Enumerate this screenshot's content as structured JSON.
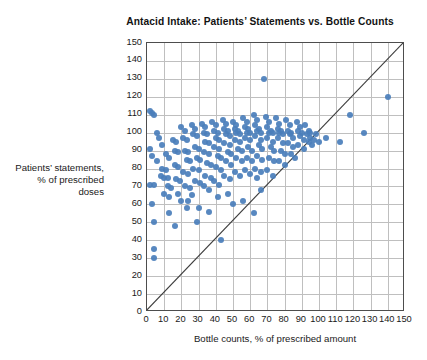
{
  "chart_data": {
    "type": "scatter",
    "title": "Antacid Intake: Patients’ Statements vs. Bottle Counts",
    "xlabel": "Bottle counts, % of prescribed amount",
    "ylabel": "Patients’ statements, % of prescribed doses",
    "xlim": [
      0,
      150
    ],
    "ylim": [
      0,
      150
    ],
    "xticks": [
      0,
      10,
      20,
      30,
      40,
      50,
      60,
      70,
      80,
      90,
      100,
      110,
      120,
      130,
      140,
      150
    ],
    "yticks": [
      0,
      10,
      20,
      30,
      40,
      50,
      60,
      70,
      80,
      90,
      100,
      110,
      120,
      130,
      140,
      150
    ],
    "grid": true,
    "legend": "none",
    "marker_color": "#4a7ebb",
    "reference_line": {
      "label": "y = x identity line",
      "from": [
        0,
        0
      ],
      "to": [
        150,
        150
      ],
      "color": "#3c3c3c"
    },
    "points": [
      [
        2,
        112
      ],
      [
        3,
        111
      ],
      [
        4,
        110
      ],
      [
        2,
        91
      ],
      [
        3,
        87
      ],
      [
        2,
        71
      ],
      [
        4,
        71
      ],
      [
        3,
        60
      ],
      [
        4,
        50
      ],
      [
        4,
        35
      ],
      [
        4,
        30
      ],
      [
        6,
        100
      ],
      [
        6,
        84
      ],
      [
        8,
        76
      ],
      [
        10,
        75
      ],
      [
        12,
        75
      ],
      [
        7,
        97
      ],
      [
        9,
        93
      ],
      [
        11,
        88
      ],
      [
        13,
        86
      ],
      [
        9,
        80
      ],
      [
        11,
        79
      ],
      [
        12,
        70
      ],
      [
        14,
        69
      ],
      [
        10,
        66
      ],
      [
        13,
        64
      ],
      [
        15,
        96
      ],
      [
        17,
        95
      ],
      [
        16,
        90
      ],
      [
        18,
        89
      ],
      [
        16,
        82
      ],
      [
        18,
        81
      ],
      [
        17,
        74
      ],
      [
        19,
        73
      ],
      [
        20,
        103
      ],
      [
        22,
        101
      ],
      [
        21,
        97
      ],
      [
        23,
        96
      ],
      [
        22,
        90
      ],
      [
        24,
        89
      ],
      [
        23,
        85
      ],
      [
        25,
        84
      ],
      [
        21,
        78
      ],
      [
        24,
        77
      ],
      [
        22,
        70
      ],
      [
        25,
        69
      ],
      [
        20,
        62
      ],
      [
        23,
        58
      ],
      [
        26,
        104
      ],
      [
        28,
        102
      ],
      [
        27,
        99
      ],
      [
        29,
        98
      ],
      [
        28,
        92
      ],
      [
        30,
        91
      ],
      [
        29,
        86
      ],
      [
        31,
        85
      ],
      [
        27,
        80
      ],
      [
        30,
        79
      ],
      [
        28,
        73
      ],
      [
        31,
        72
      ],
      [
        26,
        65
      ],
      [
        29,
        50
      ],
      [
        32,
        105
      ],
      [
        34,
        103
      ],
      [
        33,
        100
      ],
      [
        35,
        99
      ],
      [
        34,
        95
      ],
      [
        36,
        94
      ],
      [
        33,
        89
      ],
      [
        36,
        88
      ],
      [
        35,
        83
      ],
      [
        37,
        82
      ],
      [
        34,
        76
      ],
      [
        37,
        75
      ],
      [
        33,
        70
      ],
      [
        36,
        68
      ],
      [
        38,
        106
      ],
      [
        40,
        104
      ],
      [
        39,
        101
      ],
      [
        41,
        100
      ],
      [
        40,
        97
      ],
      [
        42,
        96
      ],
      [
        39,
        92
      ],
      [
        42,
        91
      ],
      [
        41,
        87
      ],
      [
        43,
        86
      ],
      [
        40,
        81
      ],
      [
        43,
        79
      ],
      [
        39,
        73
      ],
      [
        42,
        71
      ],
      [
        41,
        64
      ],
      [
        43,
        40
      ],
      [
        44,
        107
      ],
      [
        46,
        105
      ],
      [
        45,
        102
      ],
      [
        47,
        101
      ],
      [
        46,
        99
      ],
      [
        48,
        98
      ],
      [
        45,
        94
      ],
      [
        48,
        93
      ],
      [
        47,
        89
      ],
      [
        49,
        88
      ],
      [
        46,
        84
      ],
      [
        49,
        82
      ],
      [
        45,
        76
      ],
      [
        48,
        74
      ],
      [
        50,
        106
      ],
      [
        52,
        104
      ],
      [
        51,
        102
      ],
      [
        53,
        101
      ],
      [
        52,
        100
      ],
      [
        54,
        99
      ],
      [
        51,
        96
      ],
      [
        54,
        95
      ],
      [
        53,
        91
      ],
      [
        55,
        90
      ],
      [
        52,
        86
      ],
      [
        55,
        84
      ],
      [
        51,
        78
      ],
      [
        54,
        76
      ],
      [
        56,
        108
      ],
      [
        58,
        106
      ],
      [
        57,
        103
      ],
      [
        59,
        102
      ],
      [
        58,
        100
      ],
      [
        60,
        100
      ],
      [
        57,
        97
      ],
      [
        60,
        96
      ],
      [
        59,
        92
      ],
      [
        61,
        90
      ],
      [
        58,
        86
      ],
      [
        61,
        84
      ],
      [
        57,
        79
      ],
      [
        60,
        77
      ],
      [
        62,
        110
      ],
      [
        64,
        107
      ],
      [
        63,
        104
      ],
      [
        65,
        102
      ],
      [
        64,
        101
      ],
      [
        66,
        100
      ],
      [
        63,
        98
      ],
      [
        66,
        96
      ],
      [
        65,
        93
      ],
      [
        67,
        91
      ],
      [
        64,
        87
      ],
      [
        67,
        85
      ],
      [
        63,
        80
      ],
      [
        66,
        78
      ],
      [
        68,
        130
      ],
      [
        69,
        109
      ],
      [
        71,
        106
      ],
      [
        70,
        103
      ],
      [
        72,
        101
      ],
      [
        71,
        100
      ],
      [
        73,
        100
      ],
      [
        70,
        97
      ],
      [
        73,
        95
      ],
      [
        72,
        92
      ],
      [
        74,
        90
      ],
      [
        71,
        86
      ],
      [
        74,
        84
      ],
      [
        70,
        79
      ],
      [
        73,
        76
      ],
      [
        75,
        108
      ],
      [
        77,
        105
      ],
      [
        76,
        102
      ],
      [
        78,
        101
      ],
      [
        77,
        100
      ],
      [
        79,
        99
      ],
      [
        76,
        97
      ],
      [
        79,
        94
      ],
      [
        78,
        90
      ],
      [
        80,
        88
      ],
      [
        77,
        84
      ],
      [
        80,
        82
      ],
      [
        81,
        107
      ],
      [
        83,
        104
      ],
      [
        82,
        101
      ],
      [
        84,
        100
      ],
      [
        83,
        99
      ],
      [
        85,
        97
      ],
      [
        82,
        94
      ],
      [
        85,
        92
      ],
      [
        84,
        88
      ],
      [
        86,
        86
      ],
      [
        87,
        106
      ],
      [
        89,
        103
      ],
      [
        88,
        101
      ],
      [
        90,
        100
      ],
      [
        89,
        98
      ],
      [
        91,
        96
      ],
      [
        88,
        93
      ],
      [
        91,
        91
      ],
      [
        92,
        104
      ],
      [
        94,
        101
      ],
      [
        93,
        99
      ],
      [
        95,
        97
      ],
      [
        94,
        95
      ],
      [
        96,
        93
      ],
      [
        95,
        100
      ],
      [
        97,
        96
      ],
      [
        98,
        99
      ],
      [
        100,
        95
      ],
      [
        104,
        97
      ],
      [
        112,
        95
      ],
      [
        118,
        110
      ],
      [
        126,
        100
      ],
      [
        140,
        120
      ],
      [
        56,
        62
      ],
      [
        62,
        55
      ],
      [
        64,
        75
      ],
      [
        66,
        68
      ],
      [
        47,
        66
      ],
      [
        50,
        60
      ],
      [
        30,
        58
      ],
      [
        36,
        56
      ],
      [
        18,
        66
      ],
      [
        24,
        62
      ],
      [
        13,
        55
      ],
      [
        16,
        48
      ]
    ]
  }
}
